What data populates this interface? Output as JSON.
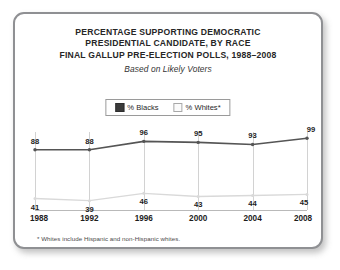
{
  "card": {
    "title_lines": [
      "PERCENTAGE SUPPORTING DEMOCRATIC",
      "PRESIDENTIAL CANDIDATE, BY RACE",
      "FINAL GALLUP PRE-ELECTION POLLS, 1988–2008"
    ],
    "subtitle": "Based on Likely Voters",
    "footnote": "* Whites include Hispanic and non-Hispanic whites."
  },
  "legend": {
    "items": [
      {
        "label": "% Blacks",
        "swatch": "dark"
      },
      {
        "label": "% Whites*",
        "swatch": "light"
      }
    ]
  },
  "colors": {
    "blacks_line": "#555555",
    "whites_line": "#d9d9d9",
    "card_border": "#8f9093",
    "grid": "#d2d2d2",
    "text": "#1d1d1d"
  },
  "chart_data": {
    "type": "line",
    "subtitle": "Based on Likely Voters",
    "xlabel": "",
    "ylabel": "",
    "ylim": [
      0,
      100
    ],
    "grid": "vertical",
    "legend_position": "top-center",
    "categories": [
      "1988",
      "1992",
      "1996",
      "2000",
      "2004",
      "2008"
    ],
    "series": [
      {
        "name": "% Blacks",
        "values": [
          88,
          88,
          96,
          95,
          93,
          99
        ]
      },
      {
        "name": "% Whites*",
        "values": [
          41,
          39,
          46,
          43,
          44,
          45
        ]
      }
    ],
    "annotations": [
      "* Whites include Hispanic and non-Hispanic whites."
    ]
  }
}
